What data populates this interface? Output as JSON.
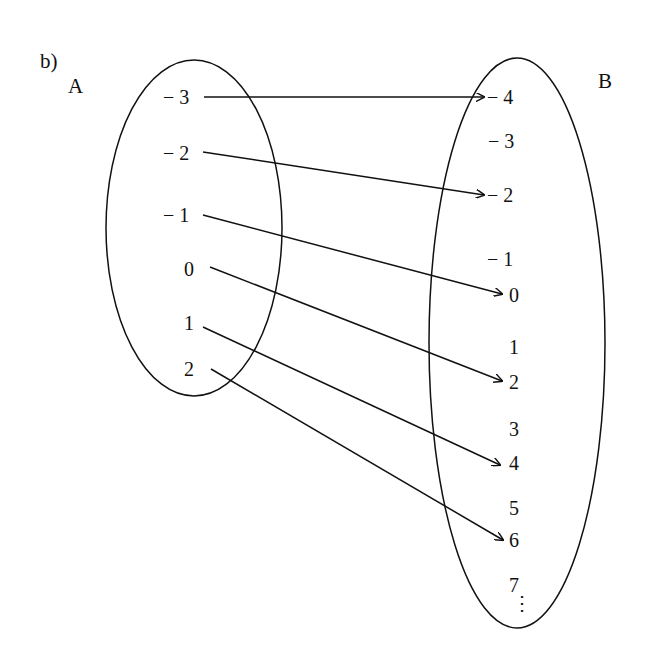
{
  "figure": {
    "part_label": "b)",
    "set_a": {
      "name": "A",
      "elements": [
        "− 3",
        "− 2",
        "− 1",
        "0",
        "1",
        "2"
      ]
    },
    "set_b": {
      "name": "B",
      "elements": [
        "− 4",
        "− 3",
        "− 2",
        "− 1",
        "0",
        "1",
        "2",
        "3",
        "4",
        "5",
        "6",
        "7",
        "⋮"
      ]
    },
    "mappings": [
      {
        "from": "-3",
        "to": "-4"
      },
      {
        "from": "-2",
        "to": "-2"
      },
      {
        "from": "-1",
        "to": "0"
      },
      {
        "from": "0",
        "to": "2"
      },
      {
        "from": "1",
        "to": "4"
      },
      {
        "from": "2",
        "to": "6"
      }
    ],
    "stroke_color": "#111111",
    "background": "#ffffff"
  }
}
